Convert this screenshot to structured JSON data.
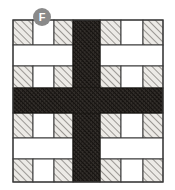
{
  "figure": {
    "canvas": {
      "width": 175,
      "height": 190,
      "background": "#ffffff"
    },
    "drawing_bounds": {
      "x": 13,
      "y": 20,
      "width": 150,
      "height": 162
    },
    "colors": {
      "background": "#ffffff",
      "outline": "#3a3a3a",
      "light_hatch_fill": "#e8e6e2",
      "light_hatch_stroke": "#6e6a66",
      "dark_hatch_fill": "#2a2724",
      "dark_hatch_stroke": "#15120f",
      "void_fill": "#ffffff",
      "badge_fill": "#8a8a8a",
      "badge_text": "#ffffff"
    }
  },
  "label_badge": {
    "letter": "F",
    "shape": "circle",
    "x": 33,
    "y": 8,
    "diameter": 18,
    "fill": "#8a8a8a",
    "text_color": "#ffffff"
  },
  "cross": {
    "name": "dark-hatched-cross",
    "description": "Dense cross-hatched vertical and horizontal bands meeting at center",
    "vertical_band": {
      "x": 73,
      "y": 20,
      "width": 27,
      "height": 162
    },
    "horizontal_band": {
      "x": 13,
      "y": 88,
      "width": 150,
      "height": 25
    },
    "fill": "#2a2724",
    "hatch": "cross-hatch-dense"
  },
  "quadrants": [
    {
      "name": "top-left",
      "x": 13,
      "y": 20,
      "width": 60,
      "height": 68,
      "rows": [
        {
          "type": "brick-row",
          "cells": [
            "hatched",
            "void",
            "hatched"
          ]
        },
        {
          "type": "void-bar",
          "cells": [
            "void"
          ]
        },
        {
          "type": "brick-row",
          "cells": [
            "hatched",
            "void",
            "hatched"
          ]
        }
      ]
    },
    {
      "name": "top-right",
      "x": 100,
      "y": 20,
      "width": 63,
      "height": 68,
      "rows": [
        {
          "type": "brick-row",
          "cells": [
            "hatched",
            "void",
            "hatched"
          ]
        },
        {
          "type": "void-bar",
          "cells": [
            "void"
          ]
        },
        {
          "type": "brick-row",
          "cells": [
            "hatched",
            "void",
            "hatched"
          ]
        }
      ]
    },
    {
      "name": "bottom-left",
      "x": 13,
      "y": 113,
      "width": 60,
      "height": 69,
      "rows": [
        {
          "type": "brick-row",
          "cells": [
            "hatched",
            "void",
            "hatched"
          ]
        },
        {
          "type": "void-bar",
          "cells": [
            "void"
          ]
        },
        {
          "type": "brick-row",
          "cells": [
            "hatched",
            "void",
            "hatched"
          ]
        }
      ]
    },
    {
      "name": "bottom-right",
      "x": 100,
      "y": 113,
      "width": 63,
      "height": 69,
      "rows": [
        {
          "type": "brick-row",
          "cells": [
            "hatched",
            "void",
            "hatched"
          ]
        },
        {
          "type": "void-bar",
          "cells": [
            "void"
          ]
        },
        {
          "type": "brick-row",
          "cells": [
            "hatched",
            "void",
            "hatched"
          ]
        }
      ]
    }
  ]
}
